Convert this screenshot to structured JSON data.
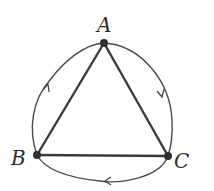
{
  "diagram": {
    "type": "directed-cycle-graph",
    "vertices": [
      {
        "id": "A",
        "label": "A",
        "x": 104,
        "y": 43
      },
      {
        "id": "B",
        "label": "B",
        "x": 37,
        "y": 155
      },
      {
        "id": "C",
        "label": "C",
        "x": 168,
        "y": 156
      }
    ],
    "straight_edges": [
      {
        "from": "A",
        "to": "B"
      },
      {
        "from": "A",
        "to": "C"
      },
      {
        "from": "B",
        "to": "C"
      }
    ],
    "curved_edges": [
      {
        "from": "A",
        "to": "C",
        "direction": "clockwise"
      },
      {
        "from": "C",
        "to": "B",
        "direction": "clockwise"
      },
      {
        "from": "B",
        "to": "A",
        "direction": "clockwise"
      }
    ],
    "colors": {
      "stroke": "#3a3a3a",
      "vertex": "#2e2e2e",
      "background": "#ffffff"
    }
  }
}
